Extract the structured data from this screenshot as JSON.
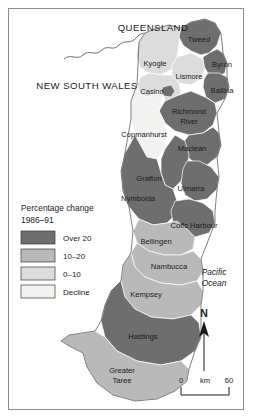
{
  "map": {
    "title_labels": [
      {
        "name": "queensland",
        "text": "QUEENSLAND",
        "x": 144,
        "y": 22
      },
      {
        "name": "new-south-wales",
        "text": "NEW SOUTH WALES",
        "x": 78,
        "y": 80
      }
    ],
    "ocean_label": {
      "line1": "Pacific",
      "line2": "Ocean",
      "x": 205,
      "y": 272
    },
    "regions": [
      {
        "id": "tweed",
        "label": "Tweed",
        "band": "over20",
        "lx": 190,
        "ly": 33
      },
      {
        "id": "byron",
        "label": "Byron",
        "band": "over20",
        "lx": 213,
        "ly": 58
      },
      {
        "id": "ballina",
        "label": "Ballina",
        "band": "over20",
        "lx": 213,
        "ly": 84
      },
      {
        "id": "lismore",
        "label": "Lismore",
        "band": "0-10",
        "lx": 180,
        "ly": 70
      },
      {
        "id": "kyogle",
        "label": "Kyogle",
        "band": "0-10",
        "lx": 146,
        "ly": 57
      },
      {
        "id": "casino",
        "label": "Casino",
        "band": "0-10",
        "lx": 145,
        "ly": 85
      },
      {
        "id": "richmond-river",
        "label": "Richmond",
        "label2": "River",
        "band": "over20",
        "lx": 180,
        "ly": 108
      },
      {
        "id": "copmanhurst",
        "label": "Copmanhurst",
        "band": "decline",
        "lx": 135,
        "ly": 128
      },
      {
        "id": "maclean",
        "label": "Maclean",
        "band": "over20",
        "lx": 183,
        "ly": 142
      },
      {
        "id": "grafton",
        "label": "Grafton",
        "band": "over20",
        "lx": 140,
        "ly": 172
      },
      {
        "id": "ulmarra",
        "label": "Ulmarra",
        "band": "over20",
        "lx": 182,
        "ly": 182
      },
      {
        "id": "nymboida",
        "label": "Nymboida",
        "band": "over20",
        "lx": 129,
        "ly": 192
      },
      {
        "id": "coffs-harbour",
        "label": "Coffs Harbour",
        "band": "over20",
        "lx": 185,
        "ly": 219
      },
      {
        "id": "bellingen",
        "label": "Bellingen",
        "band": "10-20",
        "lx": 147,
        "ly": 235
      },
      {
        "id": "nambucca",
        "label": "Nambucca",
        "band": "10-20",
        "lx": 160,
        "ly": 260
      },
      {
        "id": "kempsey",
        "label": "Kempsey",
        "band": "10-20",
        "lx": 137,
        "ly": 288
      },
      {
        "id": "hastings",
        "label": "Hastings",
        "band": "over20",
        "lx": 132,
        "ly": 330
      },
      {
        "id": "greater-taree",
        "label": "Greater",
        "label2": "Taree",
        "band": "10-20",
        "lx": 113,
        "ly": 367
      }
    ]
  },
  "legend": {
    "title_line1": "Percentage change",
    "title_line2": "1986–91",
    "items": [
      {
        "key": "over20",
        "label": "Over 20",
        "color": "#6e6e6e"
      },
      {
        "key": "10-20",
        "label": "10–20",
        "color": "#b9b9b9"
      },
      {
        "key": "0-10",
        "label": "0–10",
        "color": "#dcdcdc"
      },
      {
        "key": "decline",
        "label": "Decline",
        "color": "#f2f2f0"
      }
    ]
  },
  "compass": {
    "label": "N"
  },
  "scale": {
    "min": "0",
    "unit": "km",
    "max": "60"
  },
  "colors": {
    "over20": "#6e6e6e",
    "band10_20": "#b9b9b9",
    "band0_10": "#dcdcdc",
    "decline": "#f2f2f0",
    "frame": "#8d8d8d",
    "text": "#1a1a1a",
    "internal_border": "#ffffff",
    "coast": "#4a4a4a"
  }
}
